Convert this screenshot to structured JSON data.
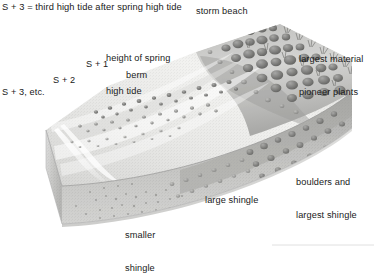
{
  "diagram": {
    "type": "block-diagram",
    "key": {
      "notation": "S + 3 = third high tide after spring high tide"
    },
    "labels": {
      "title": "S + 3 = third high tide after spring high tide",
      "storm_beach": "storm beach",
      "height_of_spring_high_tide_line1": "height of spring",
      "height_of_spring_high_tide_line2": "high tide",
      "largest_material_line1": "largest material",
      "largest_material_line2": "pioneer plants",
      "s_plus_1": "S + 1",
      "berm": "berm",
      "s_plus_2": "S + 2",
      "s_plus_3_etc": "S + 3, etc.",
      "boulders_line1": "boulders and",
      "boulders_line2": "largest shingle",
      "large_shingle": "large shingle",
      "smaller_shingle_line1": "smaller",
      "smaller_shingle_line2": "shingle"
    },
    "colors": {
      "background": "#ffffff",
      "text": "#1a1a1a",
      "beach_surface_light": "#e9e9e7",
      "beach_surface_mid": "#cfcfcd",
      "cross_section_face": "#b4b4b2",
      "cross_section_front": "#c9c9c7",
      "storm_ridge_shadow": "#9a9a98",
      "boulder_dark": "#6e6e6c",
      "boulder_mid": "#8c8c8a",
      "outline": "#8a8a88"
    },
    "features": [
      "berm ridges formed by successive high tides",
      "storm beach ridge crest with largest material",
      "pioneer plants on storm beach",
      "cross-section showing shingle graded from smaller at seaward side to boulders landward"
    ]
  }
}
